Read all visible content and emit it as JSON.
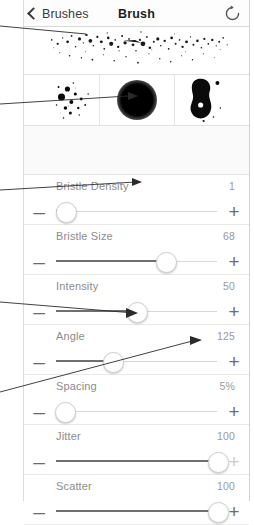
{
  "header": {
    "back_label": "Brushes",
    "title": "Brush",
    "back_icon": "chevron-left-icon",
    "reset_icon": "refresh-circular-arrow-icon"
  },
  "previews": {
    "stroke_preview_name": "brush-stroke-preview",
    "shape_cells": [
      {
        "name": "brush-dab-cluster-preview"
      },
      {
        "name": "brush-soft-round-shape-preview"
      },
      {
        "name": "brush-grain-blob-preview"
      }
    ]
  },
  "sliders": [
    {
      "label": "Bristle Density",
      "value": "1",
      "percent": 6,
      "minus": "–",
      "plus": "+",
      "plus_dim": false
    },
    {
      "label": "Bristle Size",
      "value": "68",
      "percent": 68,
      "minus": "–",
      "plus": "+",
      "plus_dim": false
    },
    {
      "label": "Intensity",
      "value": "50",
      "percent": 50,
      "minus": "–",
      "plus": "+",
      "plus_dim": false
    },
    {
      "label": "Angle",
      "value": "125",
      "percent": 35,
      "minus": "–",
      "plus": "+",
      "plus_dim": false
    },
    {
      "label": "Spacing",
      "value": "5%",
      "percent": 5,
      "minus": "–",
      "plus": "+",
      "plus_dim": false
    },
    {
      "label": "Jitter",
      "value": "100",
      "percent": 100,
      "minus": "–",
      "plus": "+",
      "plus_dim": true
    },
    {
      "label": "Scatter",
      "value": "100",
      "percent": 100,
      "minus": "–",
      "plus": "+",
      "plus_dim": false
    }
  ],
  "colors": {
    "label_gray": "#8c8c8c",
    "value_gray": "#9a9a9a",
    "track": "#d6d6d6",
    "track_fill": "#6f6f6f",
    "title": "#1d1d1d"
  }
}
